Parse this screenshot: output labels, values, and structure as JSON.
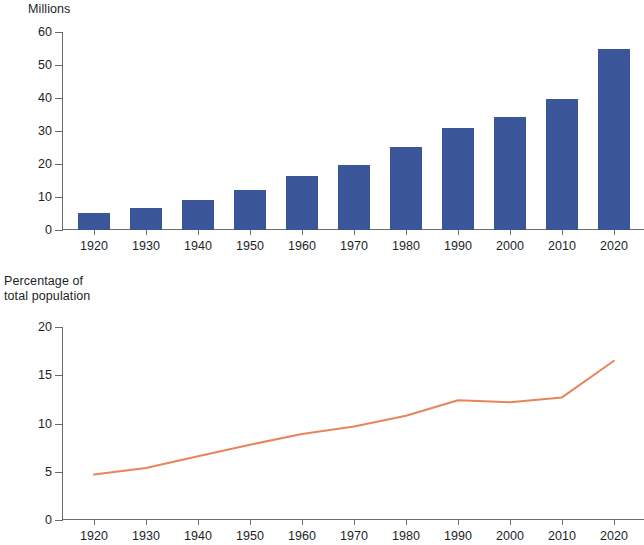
{
  "figure": {
    "bar_color": "#3b5599",
    "line_color": "#e8845a",
    "axis_color": "#6b6b6b",
    "text_color": "#221e1f",
    "background": "#ffffff"
  },
  "chart_data": [
    {
      "type": "bar",
      "title": "",
      "ylabel": "Millions",
      "xlabel": "",
      "categories": [
        "1920",
        "1930",
        "1940",
        "1950",
        "1960",
        "1970",
        "1980",
        "1990",
        "2000",
        "2010",
        "2020"
      ],
      "values": [
        5.2,
        6.8,
        9.0,
        12.2,
        16.3,
        19.8,
        25.1,
        30.8,
        34.2,
        39.7,
        55.0
      ],
      "ylim": [
        0,
        60
      ],
      "yticks": [
        0,
        10,
        20,
        30,
        40,
        50,
        60
      ],
      "ytick_labels": [
        "0",
        "10",
        "20",
        "30",
        "40",
        "50",
        "60"
      ],
      "grid": false,
      "legend": "none"
    },
    {
      "type": "line",
      "title": "",
      "ylabel": "Percentage of\ntotal population",
      "xlabel": "",
      "x": [
        "1920",
        "1930",
        "1940",
        "1950",
        "1960",
        "1970",
        "1980",
        "1990",
        "2000",
        "2010",
        "2020"
      ],
      "values": [
        4.7,
        5.4,
        6.6,
        7.8,
        8.9,
        9.7,
        10.8,
        12.4,
        12.2,
        12.7,
        16.5
      ],
      "ylim": [
        0,
        20
      ],
      "yticks": [
        0,
        5,
        10,
        15,
        20
      ],
      "ytick_labels": [
        "0",
        "5",
        "10",
        "15",
        "20"
      ],
      "grid": false,
      "legend": "none"
    }
  ],
  "bar_chart": {
    "axis_title": "Millions",
    "y_tick_labels": [
      "60",
      "50",
      "40",
      "30",
      "20",
      "10",
      "0"
    ],
    "x_tick_labels": [
      "1920",
      "1930",
      "1940",
      "1950",
      "1960",
      "1970",
      "1980",
      "1990",
      "2000",
      "2010",
      "2020"
    ]
  },
  "line_chart": {
    "axis_title": "Percentage of\ntotal population",
    "y_tick_labels": [
      "20",
      "15",
      "10",
      "5",
      "0"
    ],
    "x_tick_labels": [
      "1920",
      "1930",
      "1940",
      "1950",
      "1960",
      "1970",
      "1980",
      "1990",
      "2000",
      "2010",
      "2020"
    ]
  }
}
